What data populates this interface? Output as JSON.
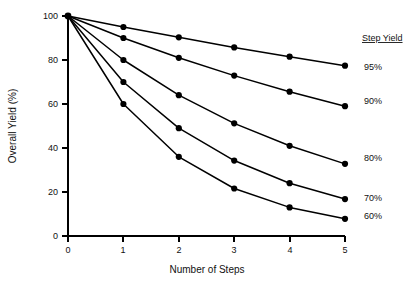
{
  "chart_data": {
    "type": "line",
    "title": "",
    "xlabel": "Number of Steps",
    "ylabel": "Overall Yield (%)",
    "x": [
      0,
      1,
      2,
      3,
      4,
      5
    ],
    "xlim": [
      0,
      5
    ],
    "ylim": [
      0,
      100
    ],
    "xticks": [
      "0",
      "1",
      "2",
      "3",
      "4",
      "5"
    ],
    "yticks": [
      "0",
      "20",
      "40",
      "60",
      "80",
      "100"
    ],
    "grid": false,
    "legend_position": "right",
    "legend_title": "Step Yield",
    "series": [
      {
        "name": "95%",
        "values": [
          100,
          95,
          90.3,
          85.7,
          81.5,
          77.4
        ]
      },
      {
        "name": "90%",
        "values": [
          100,
          90,
          81,
          72.9,
          65.6,
          59.0
        ]
      },
      {
        "name": "80%",
        "values": [
          100,
          80,
          64,
          51.2,
          41.0,
          32.8
        ]
      },
      {
        "name": "70%",
        "values": [
          100,
          70,
          49,
          34.3,
          24.0,
          16.8
        ]
      },
      {
        "name": "60%",
        "values": [
          100,
          60,
          36,
          21.6,
          13.0,
          7.8
        ]
      }
    ]
  },
  "axes": {
    "x_title": "Number of Steps",
    "y_title": "Overall Yield (%)",
    "x_tick_labels": [
      "0",
      "1",
      "2",
      "3",
      "4",
      "5"
    ],
    "y_tick_labels": [
      "0",
      "20",
      "40",
      "60",
      "80",
      "100"
    ]
  },
  "legend": {
    "title": "Step Yield",
    "entries": [
      {
        "label": "95%"
      },
      {
        "label": "90%"
      },
      {
        "label": "80%"
      },
      {
        "label": "70%"
      },
      {
        "label": "60%"
      }
    ]
  },
  "colors": {
    "line": "#000000",
    "marker": "#000000",
    "axis": "#000000",
    "background": "#ffffff",
    "text": "#111111"
  }
}
